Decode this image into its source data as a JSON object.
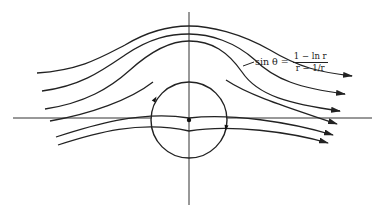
{
  "figure": {
    "width": 381,
    "height": 219,
    "stroke_color": "#222222",
    "background": "#ffffff"
  },
  "axes": {
    "horizontal": {
      "x1": 13,
      "x2": 372,
      "y": 118
    },
    "vertical": {
      "x": 189,
      "y1": 12,
      "y2": 205
    }
  },
  "cylinder": {
    "cx": 189,
    "cy": 120,
    "r": 38,
    "center_dot_r": 2.2
  },
  "annotation": {
    "lhs": "sin θ =",
    "numerator": "1 − ln r",
    "denominator": "r − 1/r",
    "leader": {
      "x1": 243,
      "y1": 66,
      "x2": 254,
      "y2": 62
    }
  },
  "streamlines": [
    {
      "name": "streamline-1",
      "d": "M37,73 C80,70 100,58 125,45 C150,30 170,26 189,26 C210,26 240,33 270,50 C300,68 320,72 352,76",
      "arrow": [
        352,
        76
      ]
    },
    {
      "name": "streamline-2",
      "d": "M42,91 C80,86 100,72 125,55 C150,38 170,34 189,34 C210,34 235,42 255,60 C275,80 300,88 345,94",
      "arrow": [
        345,
        94
      ]
    },
    {
      "name": "streamline-3",
      "d": "M45,109 C85,103 110,88 130,70 C150,52 170,41 189,41 C212,41 228,52 242,72 C258,96 290,104 340,111",
      "arrow": [
        340,
        111
      ]
    },
    {
      "name": "streamline-4",
      "d": "M50,121 C90,114 130,100 153,82",
      "arrow": null
    },
    {
      "name": "streamline-4b",
      "d": "M226,80 C250,96 290,108 337,124",
      "arrow": [
        337,
        124
      ]
    },
    {
      "name": "streamline-5",
      "d": "M56,137 C90,126 140,110 189,118 C230,113 290,122 333,135",
      "arrow": [
        333,
        135
      ]
    },
    {
      "name": "streamline-6",
      "d": "M58,145 C95,133 140,120 189,131 C230,124 290,132 328,143",
      "arrow": [
        328,
        143
      ]
    }
  ],
  "circle_markers": [
    {
      "name": "flow-direction-marker-upper-left",
      "x": 155,
      "y": 99,
      "angle": -60
    },
    {
      "name": "flow-direction-marker-lower-right",
      "x": 226,
      "y": 128,
      "angle": 100
    }
  ]
}
